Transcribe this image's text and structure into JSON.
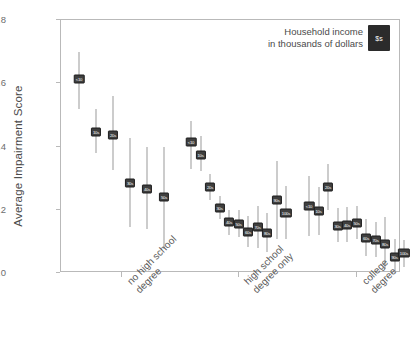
{
  "chart_data": {
    "type": "scatter",
    "title": "",
    "xlabel": "",
    "ylabel": "Average Impairment Score",
    "ylim": [
      0.0,
      0.8
    ],
    "ytick_labels": [
      "0.0",
      ".2",
      ".4",
      ".6",
      ".8"
    ],
    "ytick_values": [
      0.0,
      0.2,
      0.4,
      0.6,
      0.8
    ],
    "grid": false,
    "legend_position": "top-right",
    "legend": {
      "text": "Household income\nin thousands of dollars",
      "badge": "$s"
    },
    "categories": [
      "no high school\ndegree",
      "high school\ndegree only",
      "college degree"
    ],
    "series": [
      {
        "name": "no high school degree",
        "points": [
          {
            "label": "<10",
            "value": 0.612,
            "low": 0.52,
            "high": 0.7
          },
          {
            "label": "10s",
            "value": 0.447,
            "low": 0.378,
            "high": 0.517
          },
          {
            "label": "20s",
            "value": 0.437,
            "low": 0.327,
            "high": 0.56
          },
          {
            "label": "30s",
            "value": 0.286,
            "low": 0.145,
            "high": 0.428
          },
          {
            "label": "40s",
            "value": 0.266,
            "low": 0.14,
            "high": 0.397
          },
          {
            "label": "50s",
            "value": 0.239,
            "low": 0.075,
            "high": 0.398
          }
        ]
      },
      {
        "name": "high school degree only",
        "points": [
          {
            "label": "<10",
            "value": 0.414,
            "low": 0.33,
            "high": 0.48
          },
          {
            "label": "10s",
            "value": 0.374,
            "low": 0.322,
            "high": 0.432
          },
          {
            "label": "20s",
            "value": 0.271,
            "low": 0.232,
            "high": 0.312
          },
          {
            "label": "30s",
            "value": 0.205,
            "low": 0.17,
            "high": 0.244
          },
          {
            "label": "40s",
            "value": 0.16,
            "low": 0.12,
            "high": 0.2
          },
          {
            "label": "50s",
            "value": 0.156,
            "low": 0.113,
            "high": 0.198
          },
          {
            "label": "60s",
            "value": 0.131,
            "low": 0.081,
            "high": 0.181
          },
          {
            "label": "70s",
            "value": 0.146,
            "low": 0.079,
            "high": 0.212
          },
          {
            "label": "80s",
            "value": 0.127,
            "low": 0.066,
            "high": 0.19
          },
          {
            "label": "90s",
            "value": 0.231,
            "low": 0.108,
            "high": 0.355
          },
          {
            "label": "100s",
            "value": 0.191,
            "low": 0.108,
            "high": 0.276
          }
        ]
      },
      {
        "name": "college degree",
        "points": [
          {
            "label": "<10",
            "value": 0.212,
            "low": 0.117,
            "high": 0.308
          },
          {
            "label": "10s",
            "value": 0.196,
            "low": 0.119,
            "high": 0.272
          },
          {
            "label": "20s",
            "value": 0.273,
            "low": 0.2,
            "high": 0.345
          },
          {
            "label": "30s",
            "value": 0.15,
            "low": 0.097,
            "high": 0.206
          },
          {
            "label": "40s",
            "value": 0.152,
            "low": 0.099,
            "high": 0.208
          },
          {
            "label": "50s",
            "value": 0.159,
            "low": 0.106,
            "high": 0.213
          },
          {
            "label": "60s",
            "value": 0.112,
            "low": 0.055,
            "high": 0.17
          },
          {
            "label": "70s",
            "value": 0.103,
            "low": 0.05,
            "high": 0.16
          },
          {
            "label": "80s",
            "value": 0.093,
            "low": 0.012,
            "high": 0.177
          },
          {
            "label": "90s",
            "value": 0.05,
            "low": 0.0,
            "high": 0.106
          },
          {
            "label": "100s",
            "value": 0.062,
            "low": 0.02,
            "high": 0.105
          }
        ]
      }
    ]
  }
}
